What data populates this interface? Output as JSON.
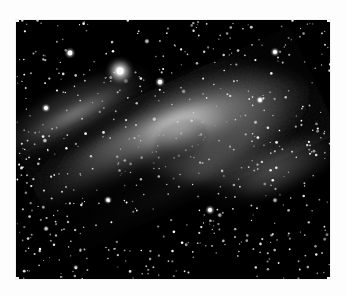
{
  "page": {
    "background_color": "#fdfdfd",
    "width": 346,
    "height": 296
  },
  "photo": {
    "subject": "Andromeda Galaxy (M31)",
    "type": "grayscale astronomical photograph",
    "frame": {
      "x": 16,
      "y": 20,
      "width": 314,
      "height": 259
    },
    "background_color": "#000000",
    "core_color": "#ffffff",
    "halo_color": "#d8d8d8",
    "dust_lane_color": "#1a1a1a",
    "star_color": "#ffffff",
    "galaxy": {
      "center_x": 181,
      "center_y": 140,
      "tilt_degrees": -25,
      "major_axis": 300,
      "minor_axis": 118,
      "core_radius": 34
    },
    "bright_star": {
      "x": 120,
      "y": 71,
      "radius": 7,
      "halo_radius": 16
    },
    "secondary_stars": [
      {
        "x": 70,
        "y": 53,
        "r": 2.4
      },
      {
        "x": 160,
        "y": 82,
        "r": 2.2
      },
      {
        "x": 275,
        "y": 52,
        "r": 2.0
      },
      {
        "x": 46,
        "y": 108,
        "r": 2.0
      },
      {
        "x": 260,
        "y": 100,
        "r": 1.9
      },
      {
        "x": 210,
        "y": 210,
        "r": 2.1
      },
      {
        "x": 108,
        "y": 200,
        "r": 1.8
      }
    ],
    "dust_lanes": [
      {
        "cx": 150,
        "cy": 160,
        "rx": 150,
        "ry": 54,
        "rot": -25,
        "opacity": 0.85
      },
      {
        "cx": 120,
        "cy": 176,
        "rx": 140,
        "ry": 42,
        "rot": -26,
        "opacity": 0.75
      },
      {
        "cx": 96,
        "cy": 120,
        "rx": 110,
        "ry": 30,
        "rot": -26,
        "opacity": 0.5
      },
      {
        "cx": 70,
        "cy": 96,
        "rx": 80,
        "ry": 20,
        "rot": -27,
        "opacity": 0.45
      }
    ],
    "star_count": 620,
    "caption": ""
  }
}
